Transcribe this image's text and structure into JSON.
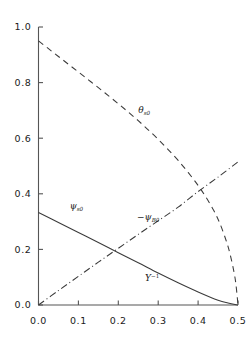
{
  "chart_data": {
    "type": "line",
    "title": "",
    "subtitle": "",
    "xlabel": "",
    "ylabel": "",
    "xlim": [
      0.0,
      0.5
    ],
    "ylim": [
      0.0,
      1.0
    ],
    "grid": false,
    "legend_position": "inline-annotations",
    "x_ticks": [
      "0.0",
      "0.1",
      "0.2",
      "0.3",
      "0.4",
      "0.5"
    ],
    "x_tick_values": [
      0.0,
      0.1,
      0.2,
      0.3,
      0.4,
      0.5
    ],
    "y_ticks": [
      "0.0",
      "0.2",
      "0.4",
      "0.6",
      "0.8",
      "1.0"
    ],
    "y_tick_values": [
      0.0,
      0.2,
      0.4,
      0.6,
      0.8,
      1.0
    ],
    "annotations": [
      {
        "id": "theta-s0",
        "text": "θ",
        "sub": "s0",
        "sup": "",
        "x": 0.265,
        "y": 0.69
      },
      {
        "id": "psi-s0",
        "text": "ψ",
        "sub": "s0",
        "sup": "",
        "x": 0.095,
        "y": 0.345
      },
      {
        "id": "minus-psi-B0",
        "text": "−ψ",
        "sub": "B0",
        "sup": "",
        "x": 0.275,
        "y": 0.305
      },
      {
        "id": "Y-inverse",
        "text": "Y",
        "sub": "",
        "sup": "−1",
        "x": 0.285,
        "y": 0.085
      }
    ],
    "series": [
      {
        "name": "theta_s0",
        "label": "θ_s0",
        "style": "dashed",
        "color": "#3a3a3a",
        "x": [
          0.0,
          0.025,
          0.05,
          0.075,
          0.1,
          0.125,
          0.15,
          0.175,
          0.2,
          0.225,
          0.25,
          0.275,
          0.3,
          0.325,
          0.35,
          0.375,
          0.4,
          0.42,
          0.44,
          0.455,
          0.47,
          0.48,
          0.49,
          0.495,
          0.5
        ],
        "y": [
          0.95,
          0.922,
          0.894,
          0.866,
          0.838,
          0.81,
          0.782,
          0.753,
          0.724,
          0.694,
          0.663,
          0.63,
          0.596,
          0.559,
          0.52,
          0.477,
          0.43,
          0.387,
          0.338,
          0.292,
          0.233,
          0.184,
          0.118,
          0.072,
          0.0
        ]
      },
      {
        "name": "psi_s0",
        "label": "ψ_s0",
        "style": "solid",
        "color": "#3a3a3a",
        "x": [
          0.0,
          0.05,
          0.1,
          0.15,
          0.2,
          0.25,
          0.3,
          0.35,
          0.4,
          0.45,
          0.475,
          0.5
        ],
        "y": [
          0.333,
          0.297,
          0.261,
          0.225,
          0.188,
          0.152,
          0.115,
          0.08,
          0.047,
          0.017,
          0.007,
          0.0
        ]
      },
      {
        "name": "minus_psi_B0",
        "label": "−ψ_B0",
        "style": "dashdot",
        "color": "#3a3a3a",
        "x": [
          0.0,
          0.05,
          0.1,
          0.15,
          0.2,
          0.25,
          0.3,
          0.35,
          0.4,
          0.45,
          0.5
        ],
        "y": [
          0.0,
          0.052,
          0.103,
          0.154,
          0.204,
          0.254,
          0.303,
          0.352,
          0.408,
          0.46,
          0.515
        ]
      }
    ]
  }
}
